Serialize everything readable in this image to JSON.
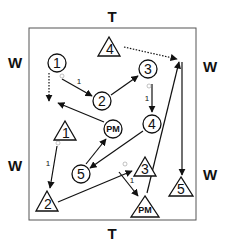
{
  "diagram": {
    "sides": {
      "top": "T",
      "bottom": "T",
      "left_upper": "W",
      "left_lower": "W",
      "right_upper": "W",
      "right_lower": "W"
    },
    "circles": [
      {
        "id": "c1",
        "label": "1"
      },
      {
        "id": "c2",
        "label": "2"
      },
      {
        "id": "c3",
        "label": "3"
      },
      {
        "id": "c4",
        "label": "4"
      },
      {
        "id": "cpm",
        "label": "PM"
      },
      {
        "id": "c5",
        "label": "5"
      }
    ],
    "triangles": [
      {
        "id": "t4",
        "label": "4"
      },
      {
        "id": "t1",
        "label": "1"
      },
      {
        "id": "t2",
        "label": "2"
      },
      {
        "id": "t3",
        "label": "3"
      },
      {
        "id": "tpm",
        "label": "PM"
      },
      {
        "id": "t5",
        "label": "5"
      }
    ],
    "pass_labels": {
      "c1_to_c2": "1",
      "c3_to_c4": "1",
      "t1_to_t2": "1",
      "t3_to_tpm": "1"
    },
    "colors": {
      "ink": "#111111",
      "background": "#ffffff",
      "border": "#555555"
    }
  }
}
